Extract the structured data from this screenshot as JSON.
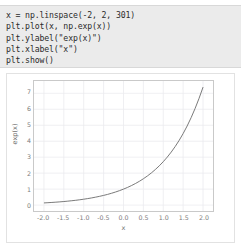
{
  "code": {
    "lines": [
      "x = np.linspace(-2, 2, 301)",
      "plt.plot(x, np.exp(x))",
      "plt.ylabel(\"exp(x)\")",
      "plt.xlabel(\"x\")",
      "plt.show()"
    ]
  },
  "chart_data": {
    "type": "line",
    "title": "",
    "xlabel": "x",
    "ylabel": "exp(x)",
    "xlim": [
      -2.25,
      2.25
    ],
    "ylim": [
      -0.37,
      7.77
    ],
    "grid": true,
    "legend": null,
    "line_color": "#6b6b6b",
    "xticks": [
      -2.0,
      -1.5,
      -1.0,
      -0.5,
      0.0,
      0.5,
      1.0,
      1.5,
      2.0
    ],
    "xticklabels": [
      "-2.0",
      "-1.5",
      "-1.0",
      "-0.5",
      "0.0",
      "0.5",
      "1.0",
      "1.5",
      "2.0"
    ],
    "yticks": [
      0,
      1,
      2,
      3,
      4,
      5,
      6,
      7
    ],
    "yticklabels": [
      "0",
      "1",
      "2",
      "3",
      "4",
      "5",
      "6",
      "7"
    ],
    "series": [
      {
        "name": "exp(x)",
        "x": [
          -2.0,
          -1.9,
          -1.8,
          -1.7,
          -1.6,
          -1.5,
          -1.4,
          -1.3,
          -1.2,
          -1.1,
          -1.0,
          -0.9,
          -0.8,
          -0.7,
          -0.6,
          -0.5,
          -0.4,
          -0.3,
          -0.2,
          -0.1,
          0.0,
          0.1,
          0.2,
          0.3,
          0.4,
          0.5,
          0.6,
          0.7,
          0.8,
          0.9,
          1.0,
          1.1,
          1.2,
          1.3,
          1.4,
          1.5,
          1.6,
          1.7,
          1.8,
          1.9,
          2.0
        ],
        "y": [
          0.135,
          0.15,
          0.165,
          0.183,
          0.202,
          0.223,
          0.247,
          0.273,
          0.301,
          0.333,
          0.368,
          0.407,
          0.449,
          0.497,
          0.549,
          0.607,
          0.67,
          0.741,
          0.819,
          0.905,
          1.0,
          1.105,
          1.221,
          1.35,
          1.492,
          1.649,
          1.822,
          2.014,
          2.226,
          2.46,
          2.718,
          3.004,
          3.32,
          3.669,
          4.055,
          4.482,
          4.953,
          5.474,
          6.05,
          6.686,
          7.389
        ]
      }
    ]
  }
}
